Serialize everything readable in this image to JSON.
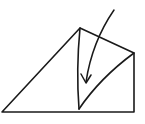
{
  "diagram": {
    "type": "fold-instruction",
    "stroke_color": "#1a1a1a",
    "background": "#ffffff",
    "shape": {
      "outline_points": [
        [
          2,
          112
        ],
        [
          80,
          28
        ],
        [
          134,
          53
        ],
        [
          134,
          112
        ]
      ],
      "inner_fold_top": [
        80,
        28
      ],
      "inner_fold_bottom": [
        79,
        109
      ],
      "inner_fold_right": [
        134,
        53
      ]
    },
    "arrow": {
      "direction": "down-curved",
      "start": [
        114,
        10
      ],
      "tip": [
        86,
        83
      ]
    }
  }
}
